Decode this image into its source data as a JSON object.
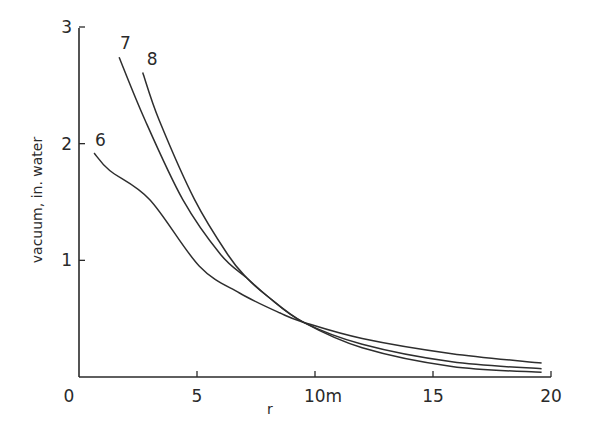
{
  "chart_data": {
    "type": "line",
    "title": "",
    "xlabel": "r",
    "ylabel": "vacuum, in. water",
    "xlim": [
      0,
      20
    ],
    "ylim": [
      0,
      3
    ],
    "x_ticks": [
      {
        "value": 0,
        "label": "0"
      },
      {
        "value": 5,
        "label": "5"
      },
      {
        "value": 10,
        "label": "10m"
      },
      {
        "value": 15,
        "label": "15"
      },
      {
        "value": 20,
        "label": "20"
      }
    ],
    "y_ticks": [
      {
        "value": 1,
        "label": "1"
      },
      {
        "value": 2,
        "label": "2"
      },
      {
        "value": 3,
        "label": "3"
      }
    ],
    "grid": false,
    "legend": "none (curves labelled inline at their start)",
    "series": [
      {
        "name": "6",
        "points": [
          [
            0.64,
            1.92
          ],
          [
            1.3,
            1.77
          ],
          [
            3.0,
            1.52
          ],
          [
            5.1,
            0.95
          ],
          [
            6.8,
            0.72
          ],
          [
            8.5,
            0.55
          ],
          [
            9.5,
            0.47
          ],
          [
            12,
            0.33
          ],
          [
            15.8,
            0.2
          ],
          [
            19.6,
            0.12
          ]
        ]
      },
      {
        "name": "7",
        "points": [
          [
            1.7,
            2.74
          ],
          [
            2.8,
            2.2
          ],
          [
            4.4,
            1.52
          ],
          [
            6.0,
            1.05
          ],
          [
            7.1,
            0.85
          ],
          [
            8.0,
            0.69
          ],
          [
            9.5,
            0.47
          ],
          [
            12,
            0.25
          ],
          [
            15.8,
            0.09
          ],
          [
            19.6,
            0.04
          ]
        ]
      },
      {
        "name": "8",
        "points": [
          [
            2.7,
            2.61
          ],
          [
            3.4,
            2.2
          ],
          [
            4.9,
            1.52
          ],
          [
            6.3,
            1.05
          ],
          [
            7.1,
            0.85
          ],
          [
            8.0,
            0.69
          ],
          [
            9.5,
            0.47
          ],
          [
            12,
            0.28
          ],
          [
            15.8,
            0.13
          ],
          [
            19.6,
            0.07
          ]
        ]
      }
    ]
  }
}
